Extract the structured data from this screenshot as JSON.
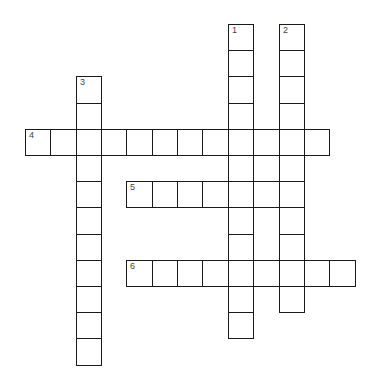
{
  "puzzle": {
    "type": "crossword",
    "grid_origin": {
      "x": 25,
      "y": 24
    },
    "cell_width": 25.35,
    "cell_height": 26.2,
    "colors": {
      "border": "#1a1a1a",
      "background": "#ffffff",
      "number": "#444444"
    },
    "entries": [
      {
        "number": "1",
        "direction": "down",
        "col": 8,
        "row": 0,
        "length": 12
      },
      {
        "number": "2",
        "direction": "down",
        "col": 10,
        "row": 0,
        "length": 11
      },
      {
        "number": "3",
        "direction": "down",
        "col": 2,
        "row": 2,
        "length": 11
      },
      {
        "number": "4",
        "direction": "across",
        "col": 0,
        "row": 4,
        "length": 12
      },
      {
        "number": "5",
        "direction": "across",
        "col": 4,
        "row": 6,
        "length": 7
      },
      {
        "number": "6",
        "direction": "across",
        "col": 4,
        "row": 9,
        "length": 9
      }
    ]
  }
}
